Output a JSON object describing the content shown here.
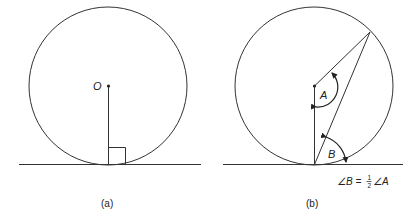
{
  "figure": {
    "panel_a": {
      "caption": "(a)",
      "center_label": "O",
      "description": "Circle with center O; radius drawn to point of tangency meets tangent line at a right angle"
    },
    "panel_b": {
      "caption": "(b)",
      "angle_at_center_label": "A",
      "angle_tangent_chord_label": "B",
      "equation": {
        "prefix": "∠B = ",
        "numerator": "1",
        "denominator": "2",
        "suffix": "∠A"
      },
      "description": "Angle between tangent and chord equals half the central angle subtended by the chord"
    },
    "colors": {
      "stroke": "#333333",
      "text": "#222222",
      "background": "#ffffff"
    }
  }
}
